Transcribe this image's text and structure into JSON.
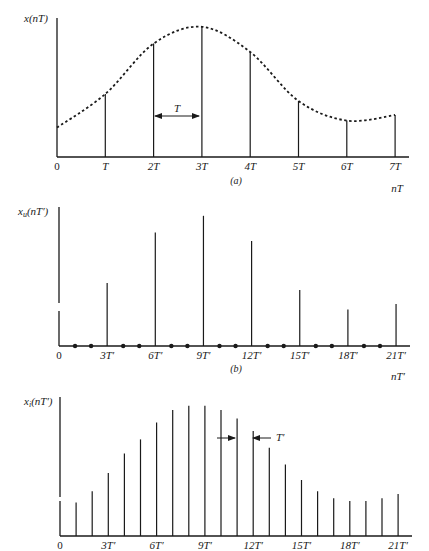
{
  "panels": {
    "a": {
      "ylabel": "x(nT)",
      "xlabel": "nT",
      "caption": "(a)",
      "zero_label": "0",
      "ticks": [
        "T",
        "2T",
        "3T",
        "4T",
        "5T",
        "6T",
        "7T"
      ],
      "interval_label": "T"
    },
    "b": {
      "ylabel_main": "x",
      "ylabel_sub": "u",
      "ylabel_rest": "(nT′)",
      "xlabel": "nT′",
      "caption": "(b)",
      "zero_label": "0",
      "ticks": [
        "3T′",
        "6T′",
        "9T′",
        "12T′",
        "15T′",
        "18T′",
        "21T′"
      ]
    },
    "c": {
      "ylabel_main": "x",
      "ylabel_sub": "i",
      "ylabel_rest": "(nT′)",
      "zero_label": "0",
      "ticks": [
        "3T′",
        "6T′",
        "9T′",
        "12T′",
        "15T′",
        "18T′",
        "21T′"
      ],
      "interval_label": "T′"
    }
  },
  "chart_data": [
    {
      "type": "line",
      "title": "(a) Original sampled signal x(nT) with continuous envelope",
      "xlabel": "nT",
      "ylabel": "x(nT)",
      "categories": [
        "0",
        "T",
        "2T",
        "3T",
        "4T",
        "5T",
        "6T",
        "7T"
      ],
      "series": [
        {
          "name": "samples x(nT)",
          "values": [
            0.21,
            0.45,
            0.81,
            0.93,
            0.75,
            0.4,
            0.26,
            0.3
          ]
        }
      ],
      "envelope": "dashed smooth curve through samples",
      "annotation": "T (sample spacing, arrow between 2T and 3T)",
      "ylim": [
        0,
        1
      ],
      "grid": false
    },
    {
      "type": "bar",
      "title": "(b) Zero-inserted (upsampled) sequence x_u(nT′)",
      "xlabel": "nT′",
      "ylabel": "x_u(nT′)",
      "x": [
        0,
        1,
        2,
        3,
        4,
        5,
        6,
        7,
        8,
        9,
        10,
        11,
        12,
        13,
        14,
        15,
        16,
        17,
        18,
        19,
        20,
        21
      ],
      "tick_labels": [
        "0",
        "3T′",
        "6T′",
        "9T′",
        "12T′",
        "15T′",
        "18T′",
        "21T′"
      ],
      "values": [
        0.21,
        0,
        0,
        0.45,
        0,
        0,
        0.81,
        0,
        0,
        0.93,
        0,
        0,
        0.75,
        0,
        0,
        0.4,
        0,
        0,
        0.26,
        0,
        0,
        0.3
      ],
      "note": "zero-valued samples shown as dots on axis",
      "ylim": [
        0,
        1
      ],
      "grid": false
    },
    {
      "type": "bar",
      "title": "(c) Interpolated sequence x_i(nT′)",
      "xlabel": "nT′",
      "ylabel": "x_i(nT′)",
      "x": [
        0,
        1,
        2,
        3,
        4,
        5,
        6,
        7,
        8,
        9,
        10,
        11,
        12,
        13,
        14,
        15,
        16,
        17,
        18,
        19,
        20,
        21
      ],
      "tick_labels": [
        "0",
        "3T′",
        "6T′",
        "9T′",
        "12T′",
        "15T′",
        "18T′",
        "21T′"
      ],
      "values": [
        0.21,
        0.24,
        0.32,
        0.45,
        0.59,
        0.69,
        0.81,
        0.9,
        0.93,
        0.93,
        0.9,
        0.84,
        0.75,
        0.63,
        0.51,
        0.4,
        0.32,
        0.27,
        0.25,
        0.25,
        0.27,
        0.3
      ],
      "annotation": "T′ (sample spacing, arrows between 10T′/11T′ and 12T′)",
      "ylim": [
        0,
        1
      ],
      "grid": false
    }
  ]
}
